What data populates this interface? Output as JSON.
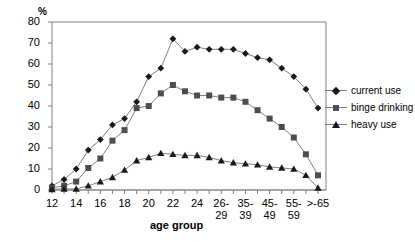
{
  "chart_data": {
    "type": "line",
    "title": "",
    "xlabel": "age group",
    "ylabel": "%",
    "ylim": [
      0,
      80
    ],
    "yticks": [
      0,
      10,
      20,
      30,
      40,
      50,
      60,
      70,
      80
    ],
    "grid": false,
    "legend_position": "right",
    "categories": [
      "12",
      "13",
      "14",
      "15",
      "16",
      "17",
      "18",
      "19",
      "20",
      "21",
      "22",
      "23",
      "24",
      "25",
      "26-29",
      "30-34",
      "35-39",
      "40-44",
      "45-49",
      "50-54",
      "55-59",
      "60-64",
      ">-65"
    ],
    "tick_labels": [
      "12",
      "",
      "14",
      "",
      "16",
      "",
      "18",
      "",
      "20",
      "",
      "22",
      "",
      "24",
      "",
      "26-\n29",
      "",
      "35-\n39",
      "",
      "45-\n49",
      "",
      "55-\n59",
      "",
      ">-65"
    ],
    "series": [
      {
        "name": "current use",
        "marker": "diamond",
        "color": "#1a1a1a",
        "values": [
          2,
          5,
          10,
          19,
          24,
          31,
          34,
          42,
          54,
          58,
          72,
          66,
          68,
          67,
          67,
          67,
          65,
          63,
          62,
          58,
          54,
          48,
          39
        ]
      },
      {
        "name": "binge drinking",
        "marker": "square",
        "color": "#4d4d4d",
        "values": [
          1,
          2,
          4,
          10.5,
          15,
          23.5,
          28.5,
          39,
          40,
          46,
          50,
          47,
          45,
          45,
          44,
          44,
          42,
          38,
          34,
          30,
          25,
          17,
          7
        ]
      },
      {
        "name": "heavy use",
        "marker": "triangle",
        "color": "#1a1a1a",
        "values": [
          0.3,
          0.5,
          0.5,
          2,
          4,
          6,
          9.5,
          14,
          15.5,
          17.5,
          17,
          16.5,
          16.5,
          15.5,
          14,
          13,
          12.5,
          12,
          11,
          10.5,
          10,
          7,
          1
        ]
      }
    ]
  },
  "legend": {
    "items": [
      {
        "label": "current use"
      },
      {
        "label": "binge drinking"
      },
      {
        "label": "heavy use"
      }
    ]
  },
  "axes": {
    "y_unit": "%",
    "x_title": "age group"
  }
}
